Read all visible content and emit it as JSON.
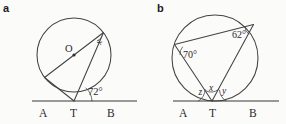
{
  "figure": {
    "panels": [
      {
        "key": "a",
        "label": "a",
        "description": "Circle with centre O, tangent line A T B touching at T, a diameter through O, and a chord from T.",
        "center_label": "O",
        "baseline_points": [
          "A",
          "T",
          "B"
        ],
        "point_a": "A",
        "point_t": "T",
        "point_b": "B",
        "angles": [
          {
            "name": "x",
            "label": "x",
            "kind": "unknown",
            "location": "inscribed-angle-top-right"
          },
          {
            "name": "angle-at-t",
            "label": "72°",
            "value": 72,
            "kind": "given",
            "location": "between-chord-and-tangent-TB"
          }
        ]
      },
      {
        "key": "b",
        "label": "b",
        "description": "Circle with tangent line A T B touching at T, two chords from T to points P and Q on the circle, and chord PQ.",
        "baseline_points": [
          "A",
          "T",
          "B"
        ],
        "point_a": "A",
        "point_t": "T",
        "point_b": "B",
        "angles": [
          {
            "name": "angle-70",
            "label": "70°",
            "value": 70,
            "kind": "given",
            "location": "upper-left-vertex"
          },
          {
            "name": "angle-62",
            "label": "62°",
            "value": 62,
            "kind": "given",
            "location": "upper-right-vertex"
          },
          {
            "name": "z",
            "label": "z",
            "kind": "unknown",
            "location": "left-of-T-between-tangent-TA-and-left-chord"
          },
          {
            "name": "x",
            "label": "x",
            "kind": "unknown",
            "location": "at-T-between-the-two-chords"
          },
          {
            "name": "y",
            "label": "y",
            "kind": "unknown",
            "location": "right-of-T-between-right-chord-and-tangent-TB"
          }
        ]
      }
    ]
  },
  "colors": {
    "ink": "#2b292b",
    "stroke": "#444244",
    "background": "#fbfbfa"
  }
}
